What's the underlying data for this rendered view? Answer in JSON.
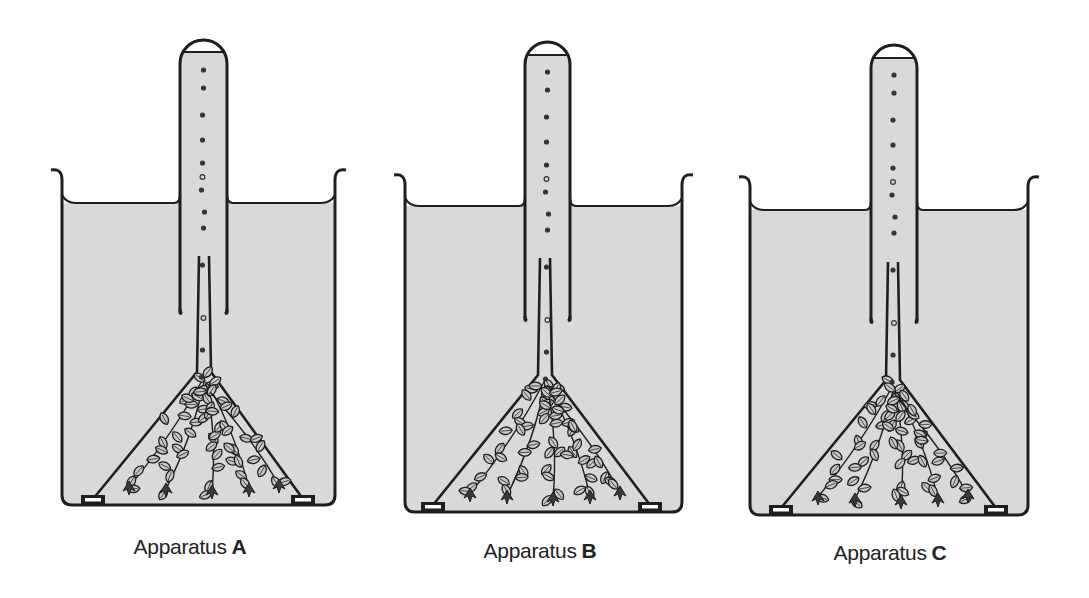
{
  "figure": {
    "colors": {
      "water": "#d9d9d9",
      "line": "#1e1e1e",
      "gas": "#ffffff",
      "background": "#ffffff"
    }
  },
  "apparatuses": [
    {
      "id": "A",
      "caption_prefix": "Apparatus",
      "caption_letter": "A",
      "caption_x": 190,
      "caption_y": 535,
      "beaker": {
        "left": 62,
        "right": 335,
        "lip_y": 170,
        "water_y": 203,
        "bottom": 505
      },
      "tube": {
        "left": 180,
        "right": 227,
        "top": 40,
        "bottom": 313,
        "gas_y": 52
      },
      "funnel": {
        "apex_x": 204,
        "apex_y": 372,
        "base_left": 93,
        "base_right": 303,
        "base_y": 499,
        "stem_top": 256
      }
    },
    {
      "id": "B",
      "caption_prefix": "Apparatus",
      "caption_letter": "B",
      "caption_x": 540,
      "caption_y": 539,
      "beaker": {
        "left": 405,
        "right": 682,
        "lip_y": 175,
        "water_y": 206,
        "bottom": 512
      },
      "tube": {
        "left": 525,
        "right": 570,
        "top": 42,
        "bottom": 320,
        "gas_y": 55
      },
      "funnel": {
        "apex_x": 545,
        "apex_y": 375,
        "base_left": 433,
        "base_right": 650,
        "base_y": 505,
        "stem_top": 258
      }
    },
    {
      "id": "C",
      "caption_prefix": "Apparatus",
      "caption_letter": "C",
      "caption_x": 890,
      "caption_y": 541,
      "beaker": {
        "left": 750,
        "right": 1028,
        "lip_y": 177,
        "water_y": 210,
        "bottom": 515
      },
      "tube": {
        "left": 871,
        "right": 917,
        "top": 45,
        "bottom": 322,
        "gas_y": 58
      },
      "funnel": {
        "apex_x": 893,
        "apex_y": 380,
        "base_left": 781,
        "base_right": 996,
        "base_y": 508,
        "stem_top": 262
      }
    }
  ],
  "bubbles_relative_y": [
    30,
    48,
    75,
    100,
    123,
    137,
    150,
    172,
    188,
    225,
    278,
    310,
    337
  ],
  "bubbles_relative_x": [
    0,
    0,
    -1,
    -1,
    -1,
    -1,
    -2,
    1,
    0,
    -1,
    0,
    -1,
    -2
  ]
}
